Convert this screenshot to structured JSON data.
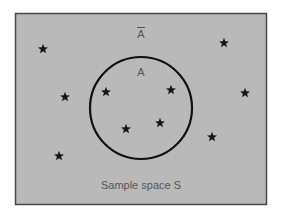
{
  "diagram": {
    "sample_space_label": "Sample space S",
    "event_label": "A",
    "complement_label": "A",
    "complement_has_overline": true,
    "outcomes_in_A": 4,
    "outcomes_in_complement": 7,
    "colors": {
      "background": "#b9b9b9",
      "border": "#4a4a4a",
      "circle": "#111111",
      "star": "#161616",
      "text": "#555555"
    }
  }
}
